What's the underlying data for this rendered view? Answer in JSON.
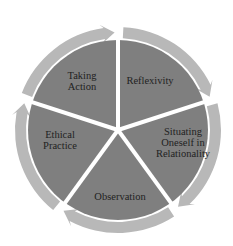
{
  "diagram": {
    "type": "cycle",
    "center": [
      118,
      130
    ],
    "colors": {
      "sector_fill": "#7f7f7f",
      "ring_fill": "#b8b8b8",
      "divider": "#ffffff",
      "text": "#222222"
    },
    "stages": [
      {
        "label": "Reflexivity",
        "pos": [
          150,
          80
        ]
      },
      {
        "label": "Situating\nOneself in\nRelationality",
        "pos": [
          183,
          142
        ]
      },
      {
        "label": "Observation",
        "pos": [
          120,
          196
        ]
      },
      {
        "label": "Ethical\nPractice",
        "pos": [
          60,
          140
        ]
      },
      {
        "label": "Taking\nAction",
        "pos": [
          82,
          81
        ]
      }
    ]
  }
}
